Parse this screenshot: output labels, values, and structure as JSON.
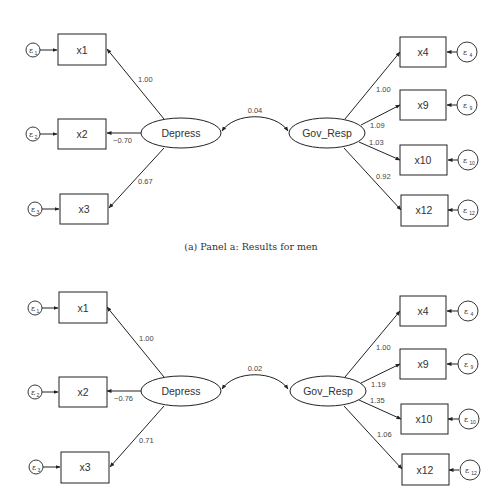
{
  "panels": [
    {
      "id": "a",
      "caption": "(a) Panel a: Results for men",
      "latent": {
        "left": "Depress",
        "right": "Gov_Resp"
      },
      "covariance": "0.04",
      "left_indicators": [
        {
          "name": "x1",
          "error": "ε",
          "error_sub": "1",
          "loading": "1.00"
        },
        {
          "name": "x2",
          "error": "ε",
          "error_sub": "2",
          "loading": "−0.70"
        },
        {
          "name": "x3",
          "error": "ε",
          "error_sub": "3",
          "loading": "0.67"
        }
      ],
      "right_indicators": [
        {
          "name": "x4",
          "error": "ε",
          "error_sub": "4",
          "loading": "1.00"
        },
        {
          "name": "x9",
          "error": "ε",
          "error_sub": "9",
          "loading": "1.09"
        },
        {
          "name": "x10",
          "error": "ε",
          "error_sub": "10",
          "loading": "1.03"
        },
        {
          "name": "x12",
          "error": "ε",
          "error_sub": "12",
          "loading": "0.92"
        }
      ]
    },
    {
      "id": "b",
      "caption": "",
      "latent": {
        "left": "Depress",
        "right": "Gov_Resp"
      },
      "covariance": "0.02",
      "left_indicators": [
        {
          "name": "x1",
          "error": "ε",
          "error_sub": "1",
          "loading": "1.00"
        },
        {
          "name": "x2",
          "error": "ε",
          "error_sub": "2",
          "loading": "−0.76"
        },
        {
          "name": "x3",
          "error": "ε",
          "error_sub": "3",
          "loading": "0.71"
        }
      ],
      "right_indicators": [
        {
          "name": "x4",
          "error": "ε",
          "error_sub": "4",
          "loading": "1.00"
        },
        {
          "name": "x9",
          "error": "ε",
          "error_sub": "9",
          "loading": "1.19"
        },
        {
          "name": "x10",
          "error": "ε",
          "error_sub": "10",
          "loading": "1.35"
        },
        {
          "name": "x12",
          "error": "ε",
          "error_sub": "12",
          "loading": "1.06"
        }
      ]
    }
  ]
}
